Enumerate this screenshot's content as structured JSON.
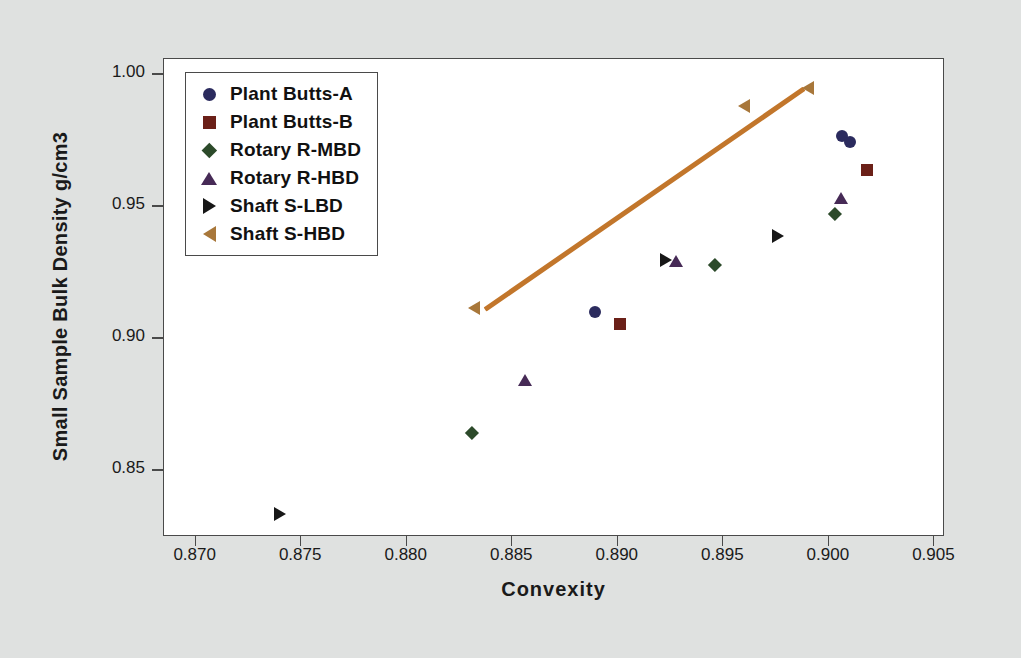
{
  "chart_data": {
    "type": "scatter",
    "title": "",
    "xlabel": "Convexity",
    "ylabel": "Small Sample Bulk Density g/cm3",
    "xlim": [
      0.8685,
      0.9055
    ],
    "ylim": [
      0.8245,
      1.0055
    ],
    "xticks": [
      "0.870",
      "0.875",
      "0.880",
      "0.885",
      "0.890",
      "0.895",
      "0.900",
      "0.905"
    ],
    "xtick_values": [
      0.87,
      0.875,
      0.88,
      0.885,
      0.89,
      0.895,
      0.9,
      0.905
    ],
    "yticks": [
      "0.85",
      "0.90",
      "0.95",
      "1.00"
    ],
    "ytick_values": [
      0.85,
      0.9,
      0.95,
      1.0
    ],
    "grid": false,
    "legend_position": "top-left",
    "series": [
      {
        "name": "Plant Butts-A",
        "marker": "circle",
        "color": "#2b2b5e",
        "points": [
          {
            "x": 0.8889,
            "y": 0.9098
          },
          {
            "x": 0.9006,
            "y": 0.9762
          },
          {
            "x": 0.901,
            "y": 0.9741
          }
        ]
      },
      {
        "name": "Plant Butts-B",
        "marker": "square",
        "color": "#6b2018",
        "points": [
          {
            "x": 0.8901,
            "y": 0.9053
          },
          {
            "x": 0.9018,
            "y": 0.9635
          }
        ]
      },
      {
        "name": "Rotary R-MBD",
        "marker": "diamond",
        "color": "#2c4a2a",
        "points": [
          {
            "x": 0.8831,
            "y": 0.864
          },
          {
            "x": 0.8946,
            "y": 0.9276
          },
          {
            "x": 0.9003,
            "y": 0.947
          }
        ]
      },
      {
        "name": "Rotary R-HBD",
        "marker": "triangle-up",
        "color": "#462a56",
        "points": [
          {
            "x": 0.8856,
            "y": 0.8838
          },
          {
            "x": 0.8928,
            "y": 0.9288
          },
          {
            "x": 0.9006,
            "y": 0.9528
          }
        ]
      },
      {
        "name": "Shaft S-LBD",
        "marker": "triangle-right",
        "color": "#171717",
        "points": [
          {
            "x": 0.874,
            "y": 0.8332
          },
          {
            "x": 0.8923,
            "y": 0.9293
          },
          {
            "x": 0.8976,
            "y": 0.9383
          }
        ]
      },
      {
        "name": "Shaft S-HBD",
        "marker": "triangle-left",
        "color": "#a8773a",
        "points": [
          {
            "x": 0.8832,
            "y": 0.911
          },
          {
            "x": 0.896,
            "y": 0.9875
          },
          {
            "x": 0.899,
            "y": 0.9945
          }
        ]
      }
    ],
    "trendline": {
      "color": "#c2762b",
      "x1": 0.8837,
      "y1": 0.9105,
      "x2": 0.8988,
      "y2": 0.994
    }
  },
  "legend": {
    "entries": [
      {
        "label": "Plant Butts-A",
        "marker": "circle",
        "color": "#2b2b5e"
      },
      {
        "label": "Plant Butts-B",
        "marker": "square",
        "color": "#6b2018"
      },
      {
        "label": "Rotary R-MBD",
        "marker": "diamond",
        "color": "#2c4a2a"
      },
      {
        "label": "Rotary R-HBD",
        "marker": "triangle-up",
        "color": "#462a56"
      },
      {
        "label": "Shaft S-LBD",
        "marker": "triangle-right",
        "color": "#171717"
      },
      {
        "label": "Shaft S-HBD",
        "marker": "triangle-left",
        "color": "#a8773a"
      }
    ]
  },
  "colors": {
    "background": "#dfe1e0",
    "plot_background": "#ffffff",
    "axis": "#4a4a4a",
    "text": "#1a1a1a",
    "trendline": "#c2762b"
  }
}
